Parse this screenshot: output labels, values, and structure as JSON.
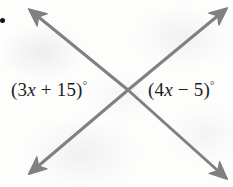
{
  "figure": {
    "background_color": "#fdfdfc",
    "bullet": {
      "name": "list-bullet",
      "color": "#16161a",
      "x": 2,
      "y": 20,
      "diameter": 5
    },
    "lines": {
      "stroke_color": "#808083",
      "stroke_width": 3,
      "intersection": {
        "x": 128,
        "y": 90
      },
      "rays": [
        {
          "name": "ray-upper-left",
          "end_x": 28,
          "end_y": 8,
          "arrowhead": true
        },
        {
          "name": "ray-upper-right",
          "end_x": 228,
          "end_y": 7,
          "arrowhead": true
        },
        {
          "name": "ray-lower-left",
          "end_x": 28,
          "end_y": 175,
          "arrowhead": true
        },
        {
          "name": "ray-lower-right",
          "end_x": 228,
          "end_y": 180,
          "arrowhead": true
        }
      ]
    },
    "labels": {
      "left": {
        "full_text": "(3x + 15)°",
        "open_paren": "(",
        "coefficient": "3",
        "variable": "x",
        "operator": "+",
        "constant": "15",
        "close_paren": ")",
        "degree": "°",
        "color": "#1c1c1e"
      },
      "right": {
        "full_text": "(4x − 5)°",
        "open_paren": "(",
        "coefficient": "4",
        "variable": "x",
        "operator": "−",
        "constant": "5",
        "close_paren": ")",
        "degree": "°",
        "color": "#1c1c1e"
      }
    }
  }
}
